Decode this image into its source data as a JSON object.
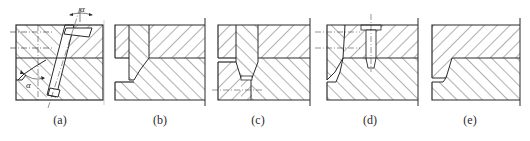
{
  "figure": {
    "line_color": "#2a2a2a",
    "background": "#ffffff",
    "panels": [
      {
        "id": "a",
        "label": "(a)",
        "center_x": 60,
        "annotations": [
          "α",
          "α"
        ],
        "feature": "inclined pin through two plates with angle α"
      },
      {
        "id": "b",
        "label": "(b)",
        "center_x": 160,
        "annotations": [],
        "feature": "tapered insert in upper plate stepping into lower plate"
      },
      {
        "id": "c",
        "label": "(c)",
        "center_x": 258,
        "annotations": [],
        "feature": "tapered conical insert with centerline"
      },
      {
        "id": "d",
        "label": "(d)",
        "center_x": 370,
        "annotations": [],
        "feature": "angled insert retained by screw"
      },
      {
        "id": "e",
        "label": "(e)",
        "center_x": 470,
        "annotations": [],
        "feature": "integral stepped parting with tapered lip"
      }
    ]
  }
}
